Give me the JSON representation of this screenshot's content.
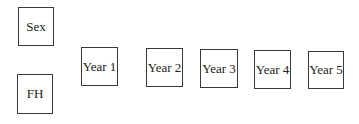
{
  "diagram": {
    "nodes": [
      {
        "id": "sex",
        "label": "Sex"
      },
      {
        "id": "fh",
        "label": "FH"
      },
      {
        "id": "year1",
        "label": "Year 1"
      },
      {
        "id": "year2",
        "label": "Year 2"
      },
      {
        "id": "year3",
        "label": "Year 3"
      },
      {
        "id": "year4",
        "label": "Year 4"
      },
      {
        "id": "year5",
        "label": "Year 5"
      }
    ],
    "edges": []
  }
}
